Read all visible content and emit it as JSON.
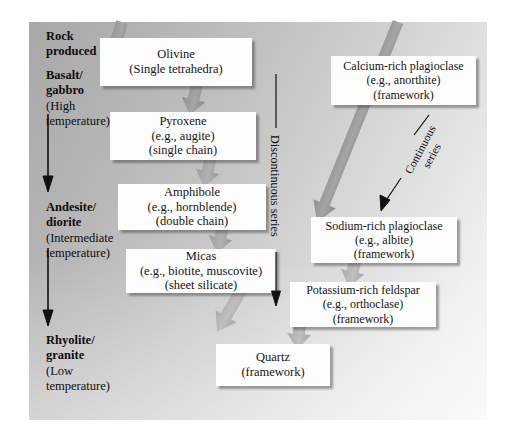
{
  "figure": {
    "type": "bowens-reaction-series-diagram",
    "panel_gradient_from": "#a8a8a8",
    "panel_gradient_to": "#f7f7f7",
    "box_fill": "#fdfdfd",
    "arrow_gray": "#9a9a9a",
    "arrow_black": "#111111"
  },
  "left_column": {
    "heading": {
      "line1": "Rock",
      "line2": "produced"
    },
    "stages": [
      {
        "line1": "Basalt/",
        "line2": "gabbro",
        "line3": "(High",
        "line4": "temperature)"
      },
      {
        "line1": "Andesite/",
        "line2": "diorite",
        "line3": "(Intermediate",
        "line4": "temperature)"
      },
      {
        "line1": "Rhyolite/",
        "line2": "granite",
        "line3": "(Low",
        "line4": "temperature)"
      }
    ]
  },
  "series_labels": {
    "discontinuous": "Discontinuous series",
    "continuous_line1": "Continuous",
    "continuous_line2": "series"
  },
  "minerals": {
    "olivine": {
      "name": "Olivine",
      "example": "(Single tetrahedra)",
      "structure": ""
    },
    "pyroxene": {
      "name": "Pyroxene",
      "example": "(e.g., augite)",
      "structure": "(single chain)"
    },
    "amphibole": {
      "name": "Amphibole",
      "example": "(e.g., hornblende)",
      "structure": "(double chain)"
    },
    "micas": {
      "name": "Micas",
      "example": "(e.g., biotite, muscovite)",
      "structure": "(sheet silicate)"
    },
    "quartz": {
      "name": "Quartz",
      "example": "(framework)",
      "structure": ""
    },
    "ca_plagioclase": {
      "name": "Calcium-rich plagioclase",
      "example": "(e.g., anorthite)",
      "structure": "(framework)"
    },
    "na_plagioclase": {
      "name": "Sodium-rich plagioclase",
      "example": "(e.g., albite)",
      "structure": "(framework)"
    },
    "k_feldspar": {
      "name": "Potassium-rich feldspar",
      "example": "(e.g., orthoclase)",
      "structure": "(framework)"
    }
  }
}
